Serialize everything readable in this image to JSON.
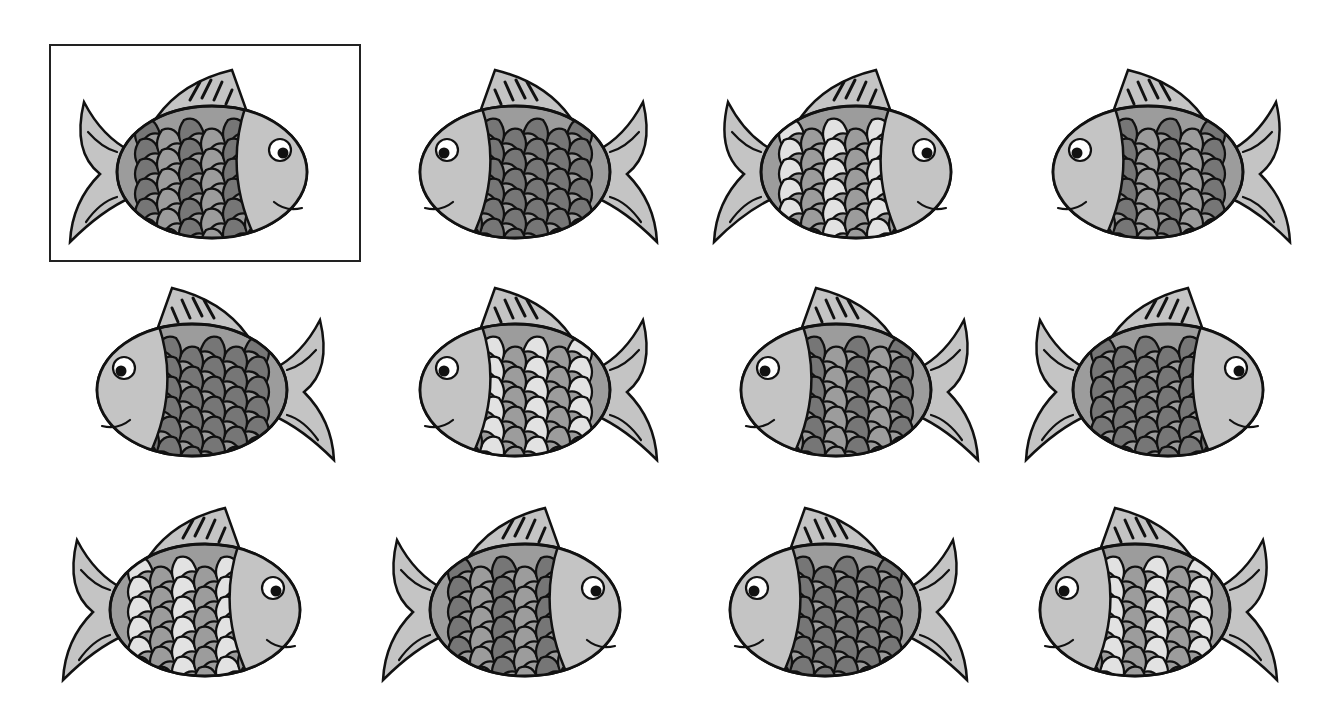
{
  "puzzle": {
    "type": "find-the-matching-fish",
    "reference_index": 0,
    "colors": {
      "outline": "#111111",
      "light": "#c4c4c4",
      "medium": "#9c9c9c",
      "dark": "#767676",
      "pale": "#e2e2e2",
      "background": "#ffffff",
      "frame": "#222222"
    },
    "fish": [
      {
        "id": 1,
        "row": 0,
        "col": 0,
        "facing": "right",
        "pattern": "mixed-dark",
        "framed": true
      },
      {
        "id": 2,
        "row": 0,
        "col": 1,
        "facing": "left",
        "pattern": "all-dark",
        "framed": false
      },
      {
        "id": 3,
        "row": 0,
        "col": 2,
        "facing": "right",
        "pattern": "pale-mixed",
        "framed": false
      },
      {
        "id": 4,
        "row": 0,
        "col": 3,
        "facing": "left",
        "pattern": "mixed-dark",
        "framed": false
      },
      {
        "id": 5,
        "row": 1,
        "col": 0,
        "facing": "left",
        "pattern": "all-dark",
        "framed": false
      },
      {
        "id": 6,
        "row": 1,
        "col": 1,
        "facing": "left",
        "pattern": "pale-mixed",
        "framed": false
      },
      {
        "id": 7,
        "row": 1,
        "col": 2,
        "facing": "left",
        "pattern": "mixed-dark",
        "framed": false
      },
      {
        "id": 8,
        "row": 1,
        "col": 3,
        "facing": "right",
        "pattern": "all-dark",
        "framed": false
      },
      {
        "id": 9,
        "row": 2,
        "col": 0,
        "facing": "right",
        "pattern": "pale-mixed",
        "framed": false
      },
      {
        "id": 10,
        "row": 2,
        "col": 1,
        "facing": "right",
        "pattern": "mixed-dark",
        "framed": false
      },
      {
        "id": 11,
        "row": 2,
        "col": 2,
        "facing": "left",
        "pattern": "all-dark",
        "framed": false
      },
      {
        "id": 12,
        "row": 2,
        "col": 3,
        "facing": "left",
        "pattern": "pale-mixed",
        "framed": false
      }
    ]
  }
}
